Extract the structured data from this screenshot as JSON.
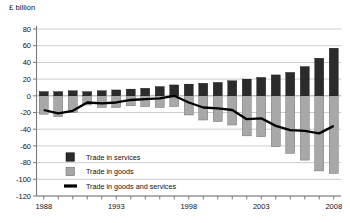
{
  "unit_label": "£ billion",
  "legend": {
    "items": [
      {
        "label": "Trade in services",
        "swatch": "dark-square",
        "color": "#2b2b2b"
      },
      {
        "label": "Trade in goods",
        "swatch": "light-square",
        "color": "#a8a8a8"
      },
      {
        "label": "Trade in goods and services",
        "swatch": "black-line",
        "color": "#000000"
      }
    ]
  },
  "axis": {
    "y_ticks": [
      "80",
      "60",
      "40",
      "20",
      "0",
      "-20",
      "-40",
      "-60",
      "-80",
      "-100",
      "-120"
    ],
    "x_ticks": [
      "1988",
      "1993",
      "1998",
      "2003",
      "2008"
    ]
  },
  "chart_data": {
    "type": "bar",
    "title": "",
    "subtitle": "",
    "xlabel": "",
    "ylabel": "£ billion",
    "ylim": [
      -120,
      80
    ],
    "grid": true,
    "legend_position": "bottom-left",
    "categories": [
      "1988",
      "1989",
      "1990",
      "1991",
      "1992",
      "1993",
      "1994",
      "1995",
      "1996",
      "1997",
      "1998",
      "1999",
      "2000",
      "2001",
      "2002",
      "2003",
      "2004",
      "2005",
      "2006",
      "2007",
      "2008"
    ],
    "series": [
      {
        "name": "Trade in services",
        "type": "bar",
        "color": "#2b2b2b",
        "values": [
          5,
          5,
          6,
          5,
          6,
          7,
          8,
          9,
          11,
          13,
          14,
          15,
          16,
          18,
          20,
          22,
          25,
          28,
          35,
          45,
          57
        ]
      },
      {
        "name": "Trade in goods",
        "type": "bar",
        "color": "#a8a8a8",
        "values": [
          -22,
          -25,
          -20,
          -11,
          -14,
          -14,
          -12,
          -13,
          -14,
          -13,
          -23,
          -29,
          -31,
          -35,
          -48,
          -49,
          -61,
          -69,
          -77,
          -90,
          -93
        ]
      },
      {
        "name": "Trade in goods and services",
        "type": "line",
        "color": "#000000",
        "values": [
          -17,
          -21,
          -18,
          -8,
          -9,
          -8,
          -5,
          -4,
          -3,
          0,
          -8,
          -14,
          -15,
          -17,
          -28,
          -27,
          -36,
          -41,
          -42,
          -45,
          -36
        ]
      }
    ]
  }
}
